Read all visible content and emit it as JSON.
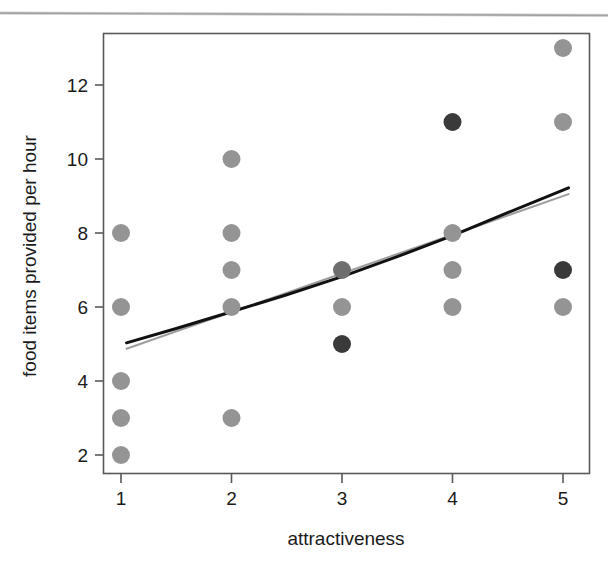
{
  "figure": {
    "background_color": "#ffffff",
    "page_rule_color": "#909090"
  },
  "chart_data": {
    "type": "scatter",
    "title": "",
    "xlabel": "attractiveness",
    "ylabel": "food items provided per hour",
    "xlim": [
      0.55,
      5.45
    ],
    "ylim": [
      1.2,
      13.6
    ],
    "xticks": [
      1,
      2,
      3,
      4,
      5
    ],
    "xticklabels": [
      "1",
      "2",
      "3",
      "4",
      "5"
    ],
    "yticks": [
      2,
      4,
      6,
      8,
      10,
      12
    ],
    "yticklabels": [
      "2",
      "4",
      "6",
      "8",
      "10",
      "12"
    ],
    "grid": false,
    "legend": "none",
    "frame": "box",
    "point_colors": {
      "light": "#949494",
      "medium": "#6e6e6e",
      "dark": "#3a3a3a"
    },
    "points": [
      {
        "x": 1,
        "y": 8,
        "shade": "light"
      },
      {
        "x": 1,
        "y": 6,
        "shade": "light"
      },
      {
        "x": 1,
        "y": 4,
        "shade": "light"
      },
      {
        "x": 1,
        "y": 3,
        "shade": "light"
      },
      {
        "x": 1,
        "y": 2,
        "shade": "light"
      },
      {
        "x": 2,
        "y": 10,
        "shade": "light"
      },
      {
        "x": 2,
        "y": 8,
        "shade": "light"
      },
      {
        "x": 2,
        "y": 7,
        "shade": "light"
      },
      {
        "x": 2,
        "y": 6,
        "shade": "light"
      },
      {
        "x": 2,
        "y": 3,
        "shade": "light"
      },
      {
        "x": 3,
        "y": 7,
        "shade": "medium"
      },
      {
        "x": 3,
        "y": 6,
        "shade": "light"
      },
      {
        "x": 3,
        "y": 5,
        "shade": "dark"
      },
      {
        "x": 4,
        "y": 11,
        "shade": "dark"
      },
      {
        "x": 4,
        "y": 8,
        "shade": "light"
      },
      {
        "x": 4,
        "y": 7,
        "shade": "light"
      },
      {
        "x": 4,
        "y": 6,
        "shade": "light"
      },
      {
        "x": 5,
        "y": 13,
        "shade": "light"
      },
      {
        "x": 5,
        "y": 11,
        "shade": "light"
      },
      {
        "x": 5,
        "y": 7,
        "shade": "dark"
      },
      {
        "x": 5,
        "y": 6,
        "shade": "light"
      }
    ],
    "point_radius": 9,
    "series": [
      {
        "name": "fitted-curve-black",
        "type": "line",
        "color": "#111111",
        "width": 3,
        "x": [
          1.05,
          1.5,
          2.0,
          2.5,
          3.0,
          3.5,
          4.0,
          4.5,
          5.05
        ],
        "y": [
          5.03,
          5.42,
          5.87,
          6.33,
          6.82,
          7.36,
          7.93,
          8.55,
          9.22
        ]
      },
      {
        "name": "fitted-line-gray",
        "type": "line",
        "color": "#9d9d9d",
        "width": 2,
        "x": [
          1.05,
          5.05
        ],
        "y": [
          4.87,
          9.05
        ]
      }
    ]
  }
}
